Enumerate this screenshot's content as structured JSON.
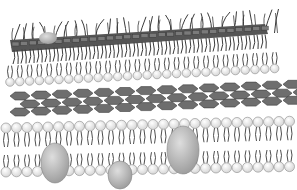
{
  "figure": {
    "layers": [
      {
        "name": "outer-layer-with-filaments",
        "y": 50
      },
      {
        "name": "upper-lipid-monolayer",
        "y": 72
      },
      {
        "name": "hexagonal-sheet",
        "y": 95
      },
      {
        "name": "lipid-bilayer",
        "y": 140
      }
    ],
    "proteins": [
      {
        "name": "integral-protein-left",
        "cx": 55,
        "cy": 163
      },
      {
        "name": "integral-protein-center",
        "cx": 120,
        "cy": 175
      },
      {
        "name": "integral-protein-right",
        "cx": 183,
        "cy": 150
      }
    ],
    "colors": {
      "head": "#d9d9d9",
      "head_stroke": "#8a8a8a",
      "tail": "#3a3a3a",
      "hex": "#6e6e6e",
      "protein": "#bdbdbd",
      "band": "#555555"
    }
  }
}
